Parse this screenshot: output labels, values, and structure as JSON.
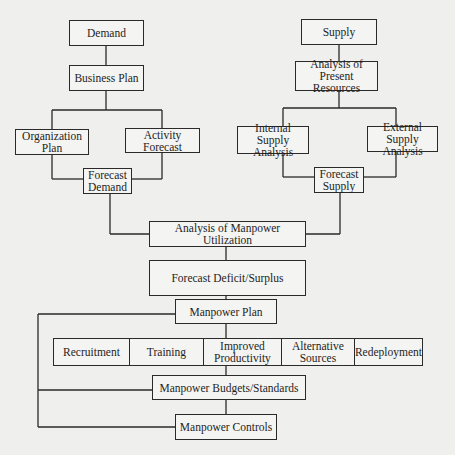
{
  "diagram": {
    "demand_side": {
      "demand": "Demand",
      "business_plan": "Business Plan",
      "organization_plan": [
        "Organization",
        "Plan"
      ],
      "activity_forecast": [
        "Activity",
        "Forecast"
      ],
      "forecast_demand": [
        "Forecast",
        "Demand"
      ]
    },
    "supply_side": {
      "supply": "Supply",
      "analysis_present_resources": [
        "Analysis of",
        "Present Resources"
      ],
      "internal_supply_analysis": [
        "Internal",
        "Supply Analysis"
      ],
      "external_supply_analysis": [
        "External Supply",
        "Analysis"
      ],
      "forecast_supply": [
        "Forecast",
        "Supply"
      ]
    },
    "main_flow": {
      "analysis_manpower_utilization": "Analysis of Manpower Utilization",
      "forecast_deficit_surplus": "Forecast Deficit/Surplus",
      "manpower_plan": "Manpower Plan",
      "actions": [
        {
          "label": [
            "Recruitment"
          ]
        },
        {
          "label": [
            "Training"
          ]
        },
        {
          "label": [
            "Improved",
            "Productivity"
          ]
        },
        {
          "label": [
            "Alternative",
            "Sources"
          ]
        },
        {
          "label": [
            "Redeployment"
          ]
        }
      ],
      "manpower_budgets_standards": "Manpower Budgets/Standards",
      "manpower_controls": "Manpower Controls"
    },
    "edges": [
      [
        "Demand",
        "Business Plan"
      ],
      [
        "Business Plan",
        "Organization Plan"
      ],
      [
        "Business Plan",
        "Activity Forecast"
      ],
      [
        "Organization Plan",
        "Forecast Demand"
      ],
      [
        "Activity Forecast",
        "Forecast Demand"
      ],
      [
        "Supply",
        "Analysis of Present Resources"
      ],
      [
        "Analysis of Present Resources",
        "Internal Supply Analysis"
      ],
      [
        "Analysis of Present Resources",
        "External Supply Analysis"
      ],
      [
        "Internal Supply Analysis",
        "Forecast Supply"
      ],
      [
        "External Supply Analysis",
        "Forecast Supply"
      ],
      [
        "Forecast Demand",
        "Analysis of Manpower Utilization"
      ],
      [
        "Forecast Supply",
        "Analysis of Manpower Utilization"
      ],
      [
        "Analysis of Manpower Utilization",
        "Forecast Deficit/Surplus"
      ],
      [
        "Forecast Deficit/Surplus",
        "Manpower Plan"
      ],
      [
        "Manpower Plan",
        "Action Row"
      ],
      [
        "Action Row",
        "Manpower Budgets/Standards"
      ],
      [
        "Manpower Budgets/Standards",
        "Manpower Controls"
      ],
      [
        "Manpower Plan",
        "Manpower Budgets/Standards (feedback)"
      ],
      [
        "Manpower Plan",
        "Manpower Controls (feedback)"
      ]
    ]
  }
}
